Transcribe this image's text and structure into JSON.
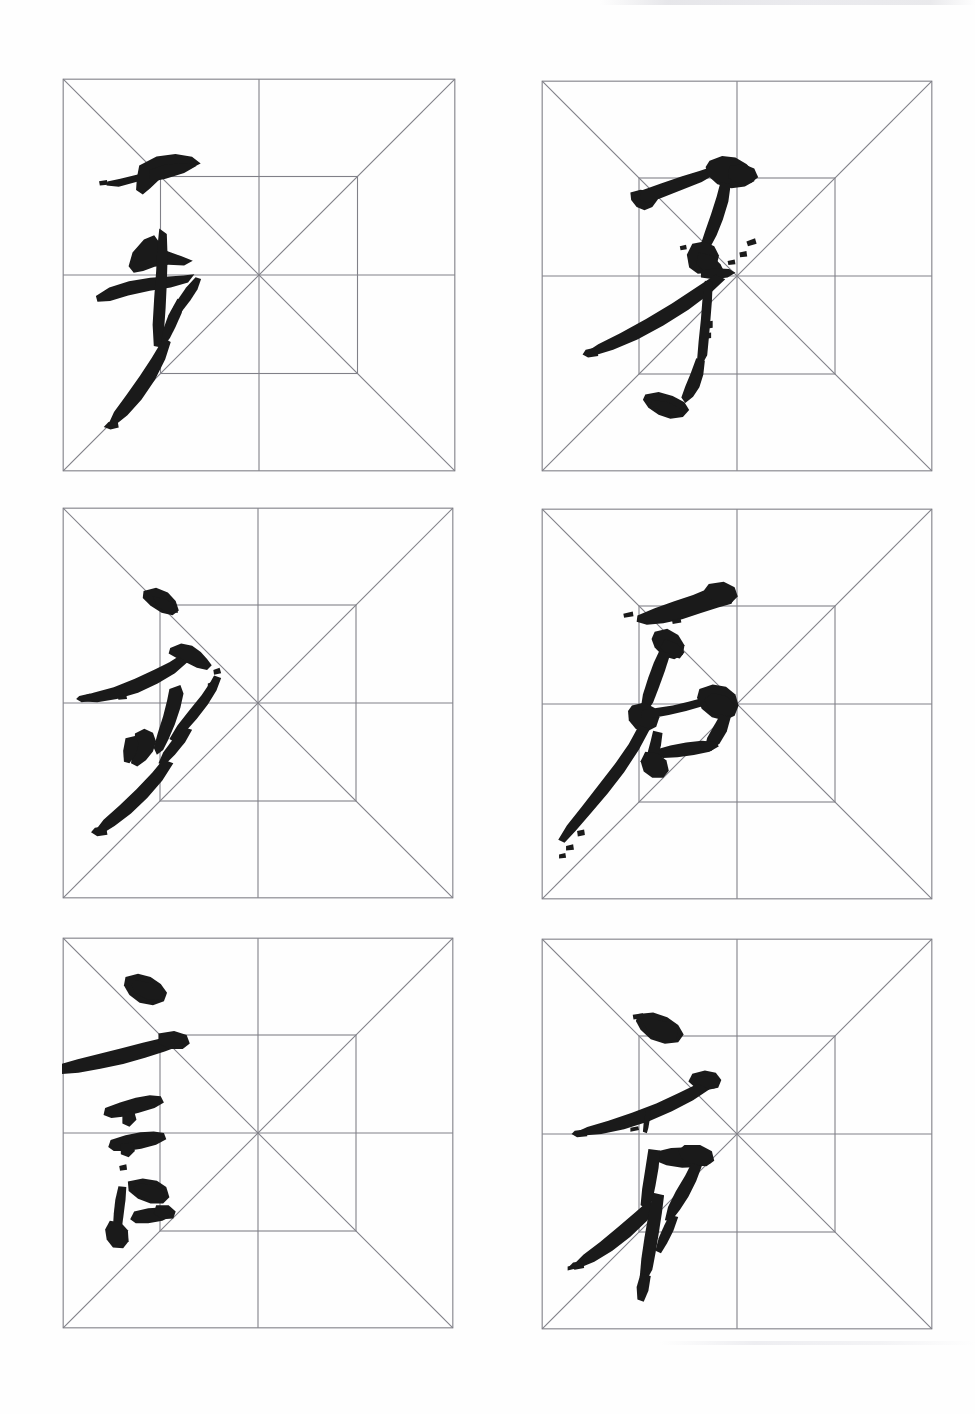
{
  "page": {
    "kind": "chinese-calligraphy-practice-sheet",
    "background_color": "#fefefe",
    "width": 975,
    "height": 1414,
    "grid_line_color": "#808088",
    "ink_color": "#1a1a1a",
    "columns": 2,
    "rows": 3,
    "grid_type": "mizige",
    "grid_guides": [
      "outer-square",
      "diagonal-tl-br",
      "diagonal-tr-bl",
      "vertical-center",
      "horizontal-center",
      "inner-square"
    ]
  },
  "layout": {
    "cells": [
      {
        "index": 0,
        "row": 0,
        "col": 0,
        "x": 62,
        "y": 78,
        "size": 394
      },
      {
        "index": 1,
        "row": 0,
        "col": 1,
        "x": 541,
        "y": 80,
        "size": 392
      },
      {
        "index": 2,
        "row": 1,
        "col": 0,
        "x": 62,
        "y": 507,
        "size": 392
      },
      {
        "index": 3,
        "row": 1,
        "col": 1,
        "x": 541,
        "y": 508,
        "size": 392
      },
      {
        "index": 4,
        "row": 2,
        "col": 0,
        "x": 62,
        "y": 937,
        "size": 392
      },
      {
        "index": 5,
        "row": 2,
        "col": 1,
        "x": 541,
        "y": 938,
        "size": 392
      }
    ]
  },
  "characters": [
    {
      "index": 0,
      "glyph": "毛",
      "script": "running-cursive",
      "position": "row-1-col-1",
      "ink_coverage": "left-of-center"
    },
    {
      "index": 1,
      "glyph": "牙",
      "script": "running-cursive",
      "position": "row-1-col-2",
      "ink_coverage": "center-left"
    },
    {
      "index": 2,
      "glyph": "少",
      "script": "running-cursive",
      "position": "row-2-col-1",
      "ink_coverage": "left-of-center"
    },
    {
      "index": 3,
      "glyph": "后",
      "script": "running-cursive",
      "position": "row-2-col-2",
      "ink_coverage": "center-left"
    },
    {
      "index": 4,
      "glyph": "言",
      "script": "running-cursive",
      "position": "row-3-col-1",
      "ink_coverage": "left-edge"
    },
    {
      "index": 5,
      "glyph": "衤",
      "script": "running-cursive",
      "position": "row-3-col-2",
      "ink_coverage": "center-left"
    }
  ],
  "chart_data": {
    "type": "table",
    "title": "",
    "categories": [
      "row-1-col-1",
      "row-1-col-2",
      "row-2-col-1",
      "row-2-col-2",
      "row-3-col-1",
      "row-3-col-2"
    ],
    "values": [
      "毛",
      "牙",
      "少",
      "后",
      "言",
      "衤"
    ]
  }
}
